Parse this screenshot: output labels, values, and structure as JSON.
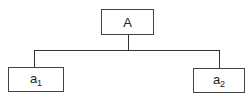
{
  "diagram": {
    "type": "tree",
    "root": {
      "label": "A"
    },
    "children": [
      {
        "label": "a",
        "subscript": "1"
      },
      {
        "label": "a",
        "subscript": "2"
      }
    ],
    "colors": {
      "stroke": "#333333",
      "fill": "#ffffff",
      "text": "#222222"
    }
  }
}
